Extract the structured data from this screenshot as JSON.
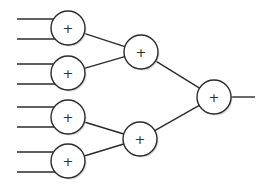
{
  "diagram": {
    "type": "binary-adder-tree",
    "colors": {
      "stroke": "#2b2b2b",
      "fill": "#ffffff",
      "shadow": "#bdbdbd",
      "label": "#333333"
    },
    "nodes": [
      {
        "id": "add-1",
        "label": "+",
        "cx": 68,
        "cy": 28,
        "r": 17
      },
      {
        "id": "add-2",
        "label": "+",
        "cx": 68,
        "cy": 73,
        "r": 17
      },
      {
        "id": "add-3",
        "label": "+",
        "cx": 68,
        "cy": 117,
        "r": 17
      },
      {
        "id": "add-4",
        "label": "+",
        "cx": 68,
        "cy": 161,
        "r": 17
      },
      {
        "id": "add-5",
        "label": "+",
        "cx": 141,
        "cy": 52,
        "r": 17
      },
      {
        "id": "add-6",
        "label": "+",
        "cx": 140,
        "cy": 139,
        "r": 17
      },
      {
        "id": "add-7",
        "label": "+",
        "cx": 214,
        "cy": 97,
        "r": 17
      }
    ],
    "inputs": [
      {
        "to": "add-1",
        "x1": 17,
        "y": 19
      },
      {
        "to": "add-1",
        "x1": 17,
        "y": 39
      },
      {
        "to": "add-2",
        "x1": 17,
        "y": 64
      },
      {
        "to": "add-2",
        "x1": 17,
        "y": 84
      },
      {
        "to": "add-3",
        "x1": 17,
        "y": 107
      },
      {
        "to": "add-3",
        "x1": 17,
        "y": 127
      },
      {
        "to": "add-4",
        "x1": 17,
        "y": 152
      },
      {
        "to": "add-4",
        "x1": 17,
        "y": 172
      }
    ],
    "edges": [
      {
        "from": "add-1",
        "to": "add-5"
      },
      {
        "from": "add-2",
        "to": "add-5"
      },
      {
        "from": "add-3",
        "to": "add-6"
      },
      {
        "from": "add-4",
        "to": "add-6"
      },
      {
        "from": "add-5",
        "to": "add-7"
      },
      {
        "from": "add-6",
        "to": "add-7"
      }
    ],
    "output": {
      "from": "add-7",
      "x2": 255
    }
  }
}
